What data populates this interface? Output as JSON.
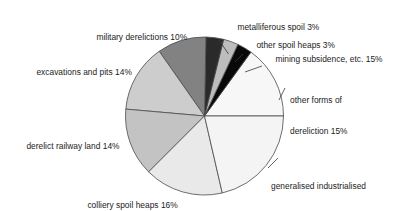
{
  "chart_data": {
    "type": "pie",
    "title": "",
    "subtitle": "",
    "xlabel": "",
    "ylabel": "",
    "legend_position": "none",
    "grid": false,
    "units": "percent",
    "total": 100,
    "start_angle_deg": 0,
    "direction": "counterclockwise",
    "center": {
      "x": 204.5,
      "y": 116
    },
    "radius": 79,
    "categories": [
      "other forms of dereliction",
      "mining subsidence, etc.",
      "other spoil heaps",
      "metalliferous spoil",
      "military derelictions",
      "excavations and pits",
      "derelict railway land",
      "colliery spoil heaps",
      "generalised industrialised dereliction"
    ],
    "values": [
      15,
      15,
      3,
      3,
      10,
      14,
      14,
      16,
      23
    ],
    "slices": [
      {
        "label": "other forms of dereliction 15%",
        "name": "other forms of dereliction",
        "value": 15,
        "value_text": "15%",
        "color": "#f7f7f7",
        "sweep_deg": 54,
        "start_deg": 0,
        "end_deg": 54,
        "label_line1": "other forms of",
        "label_line2": "dereliction 15%"
      },
      {
        "label": "mining subsidence, etc. 15%",
        "name": "mining subsidence, etc.",
        "value": 15,
        "value_text": "15%",
        "color": "#090909",
        "sweep_deg": 11,
        "start_deg": 54,
        "end_deg": 65,
        "label_line1": "mining subsidence, etc. 15%",
        "label_line2": ""
      },
      {
        "label": "other spoil heaps 3%",
        "name": "other spoil heaps",
        "value": 3,
        "value_text": "3%",
        "color": "#bdbdbd",
        "sweep_deg": 11,
        "start_deg": 65,
        "end_deg": 76,
        "label_line1": "other spoil heaps 3%",
        "label_line2": ""
      },
      {
        "label": "metalliferous spoil 3%",
        "name": "metalliferous spoil",
        "value": 3,
        "value_text": "3%",
        "color": "#2a2a2a",
        "sweep_deg": 13,
        "start_deg": 76,
        "end_deg": 89,
        "label_line1": "metalliferous spoil 3%",
        "label_line2": ""
      },
      {
        "label": "military derelictions 10%",
        "name": "military derelictions",
        "value": 10,
        "value_text": "10%",
        "color": "#828282",
        "sweep_deg": 36,
        "start_deg": 89,
        "end_deg": 125,
        "label_line1": "military derelictions 10%",
        "label_line2": ""
      },
      {
        "label": "excavations and pits 14%",
        "name": "excavations and pits",
        "value": 14,
        "value_text": "14%",
        "color": "#cdcdcd",
        "sweep_deg": 50,
        "start_deg": 125,
        "end_deg": 175,
        "label_line1": "excavations and pits 14%",
        "label_line2": ""
      },
      {
        "label": "derelict railway land 14%",
        "name": "derelict railway land",
        "value": 14,
        "value_text": "14%",
        "color": "#c3c3c3",
        "sweep_deg": 50,
        "start_deg": 175,
        "end_deg": 225,
        "label_line1": "derelict railway land 14%",
        "label_line2": ""
      },
      {
        "label": "colliery spoil heaps 16%",
        "name": "colliery spoil heaps",
        "value": 16,
        "value_text": "16%",
        "color": "#e9e9e9",
        "sweep_deg": 58,
        "start_deg": 225,
        "end_deg": 283,
        "label_line1": "colliery spoil heaps 16%",
        "label_line2": ""
      },
      {
        "label": "generalised industrialised dereliction 23%",
        "name": "generalised industrialised dereliction",
        "value": 23,
        "value_text": "23%",
        "color": "#f4f4f4",
        "sweep_deg": 77,
        "start_deg": 283,
        "end_deg": 360,
        "label_line1": "generalised industrialised",
        "label_line2": "dereliction 23%"
      }
    ],
    "stroke_color": "#4a4a4a",
    "background": "#ffffff",
    "text_color": "#1b1b1b"
  }
}
